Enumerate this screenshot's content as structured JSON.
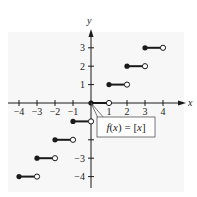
{
  "chart_data": {
    "type": "line",
    "title": "",
    "function_label": "f(x) = [x]",
    "function_label_parts": {
      "f": "f",
      "lparen": "(",
      "x": "x",
      "rparen": ")",
      "eq": " = ",
      "lbr": "[",
      "arg": "x",
      "rbr": "]"
    },
    "xlabel": "x",
    "ylabel": "y",
    "xlim": [
      -4,
      4
    ],
    "ylim": [
      -4,
      3
    ],
    "grid": false,
    "x_ticks": [
      -4,
      -3,
      -2,
      -1,
      1,
      2,
      3,
      4
    ],
    "x_tick_labels": [
      "−4",
      "−3",
      "−2",
      "−1",
      "1",
      "2",
      "3",
      "4"
    ],
    "y_ticks": [
      -4,
      -3,
      -2,
      -1,
      1,
      2,
      3
    ],
    "y_tick_labels_shown": [
      {
        "value": 3,
        "label": "3"
      },
      {
        "value": 2,
        "label": "2"
      },
      {
        "value": 1,
        "label": "1"
      },
      {
        "value": -3,
        "label": "−3"
      },
      {
        "value": -4,
        "label": "−4"
      }
    ],
    "series": [
      {
        "name": "greatest integer function",
        "segments": [
          {
            "x_start": -4,
            "x_end": -3,
            "y": -4,
            "start": "closed",
            "end": "open"
          },
          {
            "x_start": -3,
            "x_end": -2,
            "y": -3,
            "start": "closed",
            "end": "open"
          },
          {
            "x_start": -2,
            "x_end": -1,
            "y": -2,
            "start": "closed",
            "end": "open"
          },
          {
            "x_start": -1,
            "x_end": 0,
            "y": -1,
            "start": "closed",
            "end": "open"
          },
          {
            "x_start": 0,
            "x_end": 1,
            "y": 0,
            "start": "closed",
            "end": "open"
          },
          {
            "x_start": 1,
            "x_end": 2,
            "y": 1,
            "start": "closed",
            "end": "open"
          },
          {
            "x_start": 2,
            "x_end": 3,
            "y": 2,
            "start": "closed",
            "end": "open"
          },
          {
            "x_start": 3,
            "x_end": 4,
            "y": 3,
            "start": "closed",
            "end": "open"
          }
        ]
      }
    ]
  },
  "colors": {
    "plot_background": "#f7f7f7",
    "ink": "#1a1a1a",
    "callout_border": "#555555"
  }
}
